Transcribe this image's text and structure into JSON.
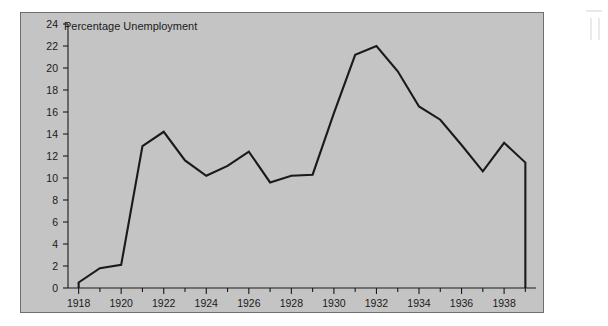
{
  "figure": {
    "background_color": "#ffffff",
    "panel_color": "#c4c4c4",
    "panel_border_color": "#6f6f6f",
    "line_color": "#1a1a1a"
  },
  "chart_data": {
    "type": "line",
    "title": "Percentage Unemployment",
    "xlabel": "",
    "ylabel": "",
    "xlim": [
      1917.5,
      1939.5
    ],
    "ylim": [
      0,
      24
    ],
    "grid": false,
    "legend": null,
    "y_ticks": [
      0,
      2,
      4,
      6,
      8,
      10,
      12,
      14,
      16,
      18,
      20,
      22,
      24
    ],
    "y_tick_labels": [
      "0",
      "2",
      "4",
      "6",
      "8",
      "10",
      "12",
      "14",
      "16",
      "18",
      "20",
      "22",
      "24"
    ],
    "x_ticks": [
      1918,
      1919,
      1920,
      1921,
      1922,
      1923,
      1924,
      1925,
      1926,
      1927,
      1928,
      1929,
      1930,
      1931,
      1932,
      1933,
      1934,
      1935,
      1936,
      1937,
      1938,
      1939
    ],
    "x_tick_labels": [
      "1918",
      "",
      "1920",
      "",
      "1922",
      "",
      "1924",
      "",
      "1926",
      "",
      "1928",
      "",
      "1930",
      "",
      "1932",
      "",
      "1934",
      "",
      "1936",
      "",
      "1938",
      ""
    ],
    "x": [
      1918,
      1919,
      1920,
      1921,
      1922,
      1923,
      1924,
      1925,
      1926,
      1927,
      1928,
      1929,
      1930,
      1931,
      1932,
      1933,
      1934,
      1935,
      1936,
      1937,
      1938,
      1939
    ],
    "values": [
      0.5,
      1.8,
      2.1,
      12.9,
      14.2,
      11.6,
      10.2,
      11.1,
      12.4,
      9.6,
      10.2,
      10.3,
      15.9,
      21.2,
      22.0,
      19.7,
      16.5,
      15.3,
      13.0,
      10.6,
      13.2,
      11.4
    ],
    "series": [
      {
        "name": "Percentage Unemployment",
        "values": [
          0.5,
          1.8,
          2.1,
          12.9,
          14.2,
          11.6,
          10.2,
          11.1,
          12.4,
          9.6,
          10.2,
          10.3,
          15.9,
          21.2,
          22.0,
          19.7,
          16.5,
          15.3,
          13.0,
          10.6,
          13.2,
          11.4
        ]
      }
    ]
  }
}
